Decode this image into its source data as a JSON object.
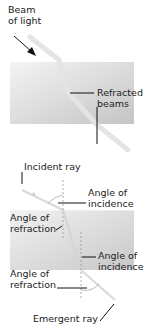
{
  "top_panel": {
    "beam_label_line1": "Beam",
    "beam_label_line2": "of light",
    "refracted_label_line1": "Refracted",
    "refracted_label_line2": "beams"
  },
  "bottom_panel": {
    "incident_ray": "Incident ray",
    "angle_incidence_1_line1": "Angle of",
    "angle_incidence_1_line2": "incidence",
    "angle_refraction_1_line1": "Angle of",
    "angle_refraction_1_line2": "refraction",
    "angle_incidence_2_line1": "Angle of",
    "angle_incidence_2_line2": "incidence",
    "angle_refraction_2_line1": "Angle of",
    "angle_refraction_2_line2": "refraction",
    "emergent_ray": "Emergent ray"
  },
  "colors": {
    "block_light": "#ededed",
    "block_dark": "#c9c9c9",
    "beam": "#e2e2e2",
    "text": "#222222"
  }
}
